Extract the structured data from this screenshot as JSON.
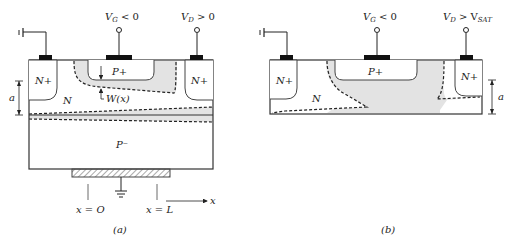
{
  "figure_a": {
    "caption": "(a)",
    "gate_label": "V",
    "gate_sub": "G",
    "gate_cond": " < 0",
    "drain_label": "V",
    "drain_sub": "D",
    "drain_cond": " > 0",
    "source_region": "N+",
    "gate_region": "P+",
    "drain_region": "N+",
    "channel_region": "N",
    "substrate_region": "P⁻",
    "depletion_label": "W(x)",
    "thickness_label": "a",
    "x0_label": "x = O",
    "xL_label": "x = L",
    "axis_label": "x"
  },
  "figure_b": {
    "caption": "(b)",
    "gate_label": "V",
    "gate_sub": "G",
    "gate_cond": " < 0",
    "drain_label": "V",
    "drain_sub": "D",
    "drain_cond": " > V",
    "drain_sat_sub": "SAT",
    "source_region": "N+",
    "gate_region": "P+",
    "drain_region": "N+",
    "channel_region": "N",
    "thickness_label": "a"
  },
  "colors": {
    "depletion_fill": "#e3e3e3",
    "outline": "#333333",
    "contact": "#111111"
  }
}
